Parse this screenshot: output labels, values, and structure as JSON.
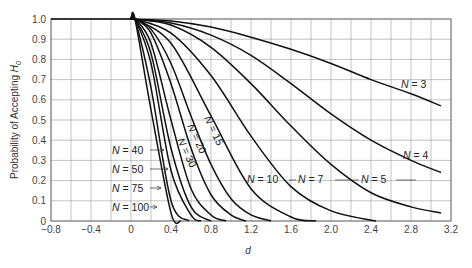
{
  "chart_data": {
    "type": "line",
    "title": "",
    "xlabel": "d",
    "ylabel": "Probability of Accepting H0",
    "ylabel_main": "Probability of Accepting ",
    "ylabel_sym": "H",
    "ylabel_sub": "0",
    "xlim": [
      -0.8,
      3.2
    ],
    "ylim": [
      0,
      1.0
    ],
    "grid": true,
    "grid_x_step": 0.2,
    "grid_y_step": 0.1,
    "xticks": [
      -0.8,
      -0.4,
      0,
      0.4,
      0.8,
      1.2,
      1.6,
      2.0,
      2.4,
      2.8,
      3.2
    ],
    "xtick_labels": [
      "−0.8",
      "−0.4",
      "0",
      "0.4",
      "0.8",
      "1.2",
      "1.6",
      "2.0",
      "2.4",
      "2.8",
      "3.2"
    ],
    "yticks": [
      0,
      0.1,
      0.2,
      0.3,
      0.4,
      0.5,
      0.6,
      0.7,
      0.8,
      0.9,
      1.0
    ],
    "ytick_labels": [
      "0",
      "0.1",
      "0.2",
      "0.3",
      "0.4",
      "0.5",
      "0.6",
      "0.7",
      "0.8",
      "0.9",
      "1.0"
    ],
    "baseline": {
      "name": "all-N",
      "points": [
        [
          -0.8,
          1.0
        ],
        [
          0,
          1.0
        ]
      ]
    },
    "series": [
      {
        "name": "N = 3",
        "N": 3,
        "points": [
          [
            0,
            1
          ],
          [
            0.4,
            0.99
          ],
          [
            0.8,
            0.96
          ],
          [
            1.2,
            0.91
          ],
          [
            1.6,
            0.85
          ],
          [
            2.0,
            0.78
          ],
          [
            2.4,
            0.7
          ],
          [
            2.8,
            0.63
          ],
          [
            3.1,
            0.57
          ]
        ]
      },
      {
        "name": "N = 4",
        "N": 4,
        "points": [
          [
            0,
            1
          ],
          [
            0.4,
            0.98
          ],
          [
            0.8,
            0.92
          ],
          [
            1.2,
            0.82
          ],
          [
            1.6,
            0.68
          ],
          [
            2.0,
            0.53
          ],
          [
            2.4,
            0.4
          ],
          [
            2.8,
            0.3
          ],
          [
            3.1,
            0.24
          ]
        ]
      },
      {
        "name": "N = 5",
        "N": 5,
        "points": [
          [
            0,
            1
          ],
          [
            0.4,
            0.97
          ],
          [
            0.8,
            0.86
          ],
          [
            1.2,
            0.68
          ],
          [
            1.6,
            0.47
          ],
          [
            2.0,
            0.28
          ],
          [
            2.4,
            0.14
          ],
          [
            2.8,
            0.07
          ],
          [
            3.1,
            0.04
          ]
        ]
      },
      {
        "name": "N = 7",
        "N": 7,
        "points": [
          [
            0,
            1
          ],
          [
            0.4,
            0.93
          ],
          [
            0.8,
            0.72
          ],
          [
            1.2,
            0.42
          ],
          [
            1.6,
            0.17
          ],
          [
            2.0,
            0.05
          ],
          [
            2.45,
            0
          ]
        ]
      },
      {
        "name": "N = 10",
        "N": 10,
        "points": [
          [
            0,
            1
          ],
          [
            0.4,
            0.88
          ],
          [
            0.8,
            0.52
          ],
          [
            1.2,
            0.16
          ],
          [
            1.6,
            0.02
          ],
          [
            1.85,
            0
          ]
        ]
      },
      {
        "name": "N = 15",
        "N": 15,
        "points": [
          [
            0,
            1
          ],
          [
            0.2,
            0.95
          ],
          [
            0.4,
            0.78
          ],
          [
            0.6,
            0.52
          ],
          [
            0.8,
            0.28
          ],
          [
            1.0,
            0.11
          ],
          [
            1.2,
            0.03
          ],
          [
            1.4,
            0
          ]
        ]
      },
      {
        "name": "N = 20",
        "N": 20,
        "points": [
          [
            0,
            1
          ],
          [
            0.2,
            0.93
          ],
          [
            0.4,
            0.68
          ],
          [
            0.6,
            0.36
          ],
          [
            0.8,
            0.13
          ],
          [
            1.0,
            0.03
          ],
          [
            1.15,
            0
          ]
        ]
      },
      {
        "name": "N = 30",
        "N": 30,
        "points": [
          [
            0,
            1
          ],
          [
            0.2,
            0.88
          ],
          [
            0.4,
            0.5
          ],
          [
            0.6,
            0.16
          ],
          [
            0.8,
            0.03
          ],
          [
            0.95,
            0
          ]
        ]
      },
      {
        "name": "N = 40",
        "N": 40,
        "points": [
          [
            0,
            1
          ],
          [
            0.2,
            0.83
          ],
          [
            0.4,
            0.36
          ],
          [
            0.6,
            0.07
          ],
          [
            0.8,
            0
          ]
        ]
      },
      {
        "name": "N = 50",
        "N": 50,
        "points": [
          [
            0,
            1
          ],
          [
            0.2,
            0.78
          ],
          [
            0.4,
            0.25
          ],
          [
            0.6,
            0.03
          ],
          [
            0.7,
            0
          ]
        ]
      },
      {
        "name": "N = 75",
        "N": 75,
        "points": [
          [
            0,
            1
          ],
          [
            0.2,
            0.66
          ],
          [
            0.4,
            0.1
          ],
          [
            0.58,
            0
          ]
        ]
      },
      {
        "name": "N = 100",
        "N": 100,
        "points": [
          [
            0,
            1
          ],
          [
            0.2,
            0.55
          ],
          [
            0.4,
            0.04
          ],
          [
            0.5,
            0
          ]
        ]
      }
    ],
    "annotations": [
      {
        "text": "N = 3",
        "series": "N = 3",
        "style": "inline"
      },
      {
        "text": "N = 4",
        "series": "N = 4",
        "style": "inline"
      },
      {
        "text": "N = 5",
        "series": "N = 5",
        "style": "inline"
      },
      {
        "text": "N = 7",
        "series": "N = 7",
        "style": "inline"
      },
      {
        "text": "N = 10",
        "series": "N = 10",
        "style": "inline"
      },
      {
        "text": "N = 15",
        "series": "N = 15",
        "style": "rotated"
      },
      {
        "text": "N = 20",
        "series": "N = 20",
        "style": "rotated"
      },
      {
        "text": "N = 30",
        "series": "N = 30",
        "style": "rotated"
      },
      {
        "text": "N = 40",
        "series": "N = 40",
        "style": "leader"
      },
      {
        "text": "N = 50",
        "series": "N = 50",
        "style": "leader"
      },
      {
        "text": "N = 75",
        "series": "N = 75",
        "style": "leader"
      },
      {
        "text": "N = 100",
        "series": "N = 100",
        "style": "leader"
      }
    ]
  }
}
